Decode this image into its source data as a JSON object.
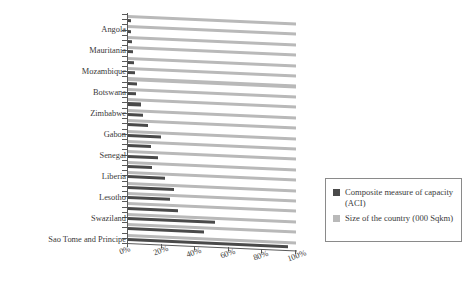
{
  "chart_data": {
    "type": "bar",
    "orientation": "horizontal",
    "title": "",
    "xlabel": "",
    "ylabel": "",
    "xlim": [
      0,
      100
    ],
    "xticks": [
      "0%",
      "20%",
      "40%",
      "60%",
      "80%",
      "100%"
    ],
    "grid": false,
    "legend_position": "right",
    "categories": [
      "Algeria",
      "Angola",
      "Sudan",
      "Mauritania",
      "Niger",
      "Mozambique",
      "Zambia",
      "Botswana",
      "Namibia",
      "Zimbabwe",
      "Congo",
      "Gabon",
      "Ghana",
      "Senegal",
      "Benin",
      "Liberia",
      "Malawi",
      "Lesotho",
      "Burundi",
      "Swaziland",
      "Comoros",
      "Sao Tome and Principe"
    ],
    "axis_labels_shown": [
      "Angola",
      "Mauritania",
      "Mozambique",
      "Botswana",
      "Zimbabwe",
      "Gabon",
      "Senegal",
      "Liberia",
      "Lesotho",
      "Swaziland",
      "Sao Tome and Principe"
    ],
    "series": [
      {
        "name": "Composite measure of capacity (ACI)",
        "color": "#4a4a4a",
        "values": [
          1.5,
          2.0,
          2.5,
          3.0,
          3.5,
          4.0,
          5.5,
          5.0,
          7.5,
          9.0,
          12.0,
          19.5,
          13.5,
          18.0,
          14.0,
          22.0,
          27.5,
          25.0,
          29.5,
          52.0,
          45.0,
          95.0
        ]
      },
      {
        "name": "Size of the country (000 Sqkm)",
        "color": "#b9b9b9",
        "values": [
          100,
          100,
          100,
          100,
          100,
          100,
          100,
          100,
          100,
          100,
          100,
          100,
          100,
          100,
          100,
          100,
          100,
          100,
          100,
          100,
          100,
          100
        ]
      }
    ]
  },
  "legend": {
    "items": [
      {
        "label": "Composite measure of capacity (ACI)",
        "color": "#4a4a4a"
      },
      {
        "label": "Size of the country (000 Sqkm)",
        "color": "#b9b9b9"
      }
    ]
  }
}
